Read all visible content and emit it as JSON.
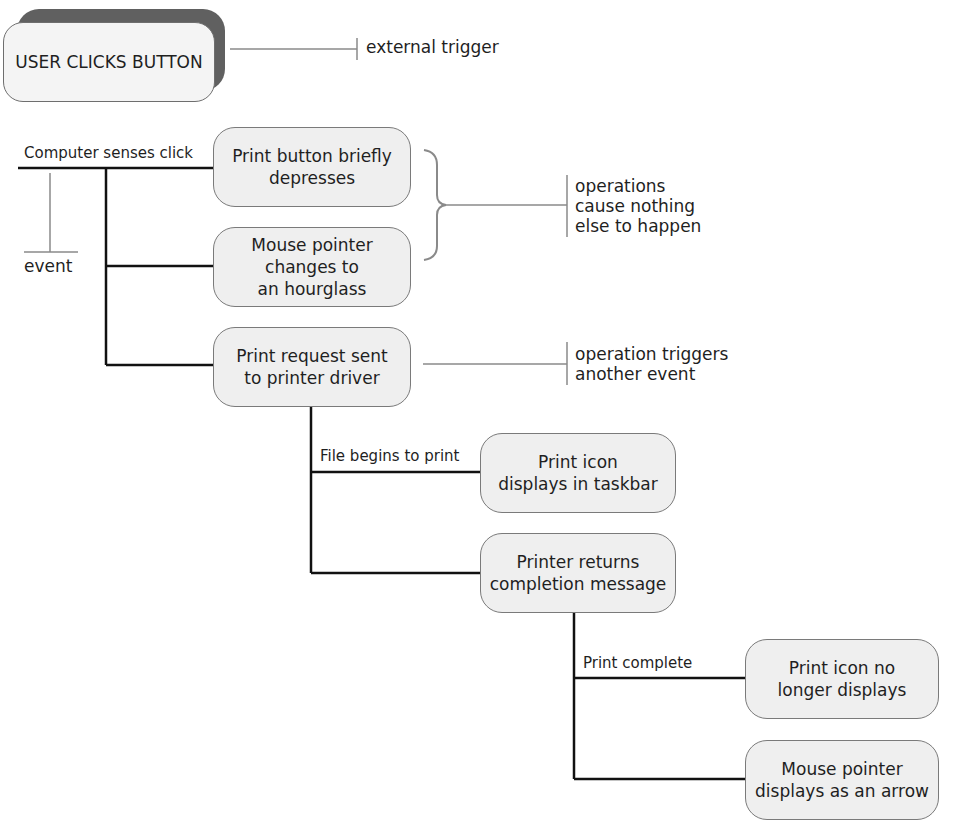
{
  "diagram": {
    "title_node": {
      "label": "USER CLICKS BUTTON",
      "annotation": "external trigger"
    },
    "event": {
      "edge_label": "Computer senses click",
      "side_label": "event"
    },
    "nodes": [
      {
        "id": "n1",
        "label": "Print button briefly\ndepresses"
      },
      {
        "id": "n2",
        "label": "Mouse pointer\nchanges to\nan hourglass"
      },
      {
        "id": "n3",
        "label": "Print request sent\nto printer driver"
      },
      {
        "id": "n4",
        "label": "Print icon\ndisplays in taskbar"
      },
      {
        "id": "n5",
        "label": "Printer returns\ncompletion message"
      },
      {
        "id": "n6",
        "label": "Print icon no\nlonger displays"
      },
      {
        "id": "n7",
        "label": "Mouse pointer\ndisplays as an arrow"
      }
    ],
    "edge_labels": {
      "file_begins": "File begins to print",
      "print_complete": "Print complete"
    },
    "annotations": {
      "no_effect": "operations\ncause nothing\nelse to happen",
      "triggers": "operation triggers\nanother event"
    },
    "colors": {
      "node_fill": "#efefef",
      "node_border": "#7a7a7a",
      "shadow": "#606060",
      "line": "#111111",
      "annotation_line": "#8a8a8a"
    }
  }
}
